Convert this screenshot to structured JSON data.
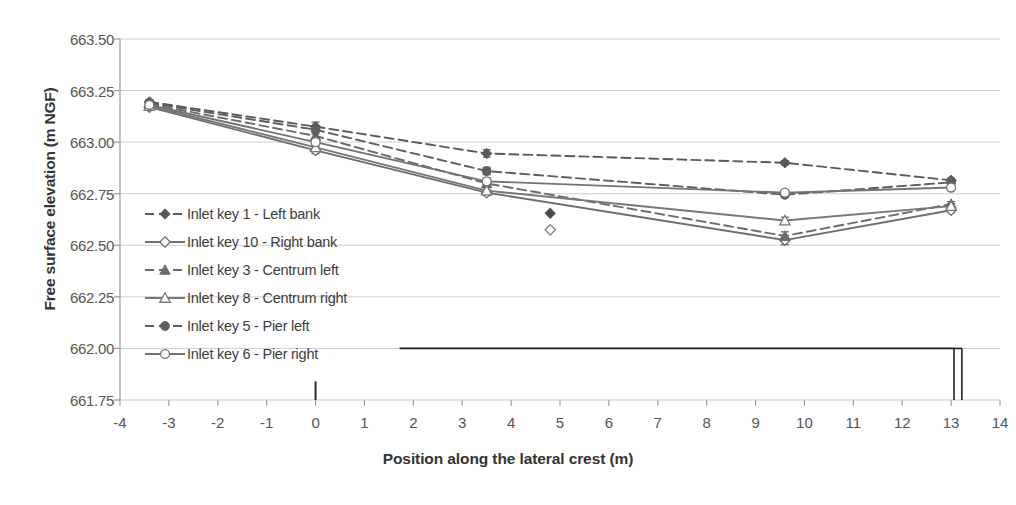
{
  "chart_data": {
    "type": "line",
    "title": "",
    "xlabel": "Position along the lateral crest (m)",
    "ylabel": "Free surface elevation (m NGF)",
    "xlim": [
      -4,
      14
    ],
    "ylim": [
      661.75,
      663.5
    ],
    "ytick_step": 0.25,
    "xtick_step": 1,
    "grid": "horizontal",
    "legend_position": "inside-left",
    "xticks": [
      "-4",
      "-3",
      "-2",
      "-1",
      "0",
      "1",
      "2",
      "3",
      "4",
      "5",
      "6",
      "7",
      "8",
      "9",
      "10",
      "11",
      "12",
      "13",
      "14"
    ],
    "yticks": [
      "661.75",
      "662.00",
      "662.25",
      "662.50",
      "662.75",
      "663.00",
      "663.25",
      "663.50"
    ],
    "x": [
      -3.4,
      0,
      3.5,
      9.6,
      13.0
    ],
    "series": [
      {
        "name": "Inlet key 1 - Left bank",
        "style": "dashed",
        "marker": "diamond-filled",
        "color": "#595959",
        "values": [
          663.195,
          663.075,
          662.945,
          662.9,
          662.815
        ],
        "errors": [
          0.012,
          0.022,
          0.018,
          0.01,
          0.01
        ]
      },
      {
        "name": "Inlet key 10 - Right bank",
        "style": "solid",
        "marker": "diamond-open",
        "color": "#6e6e6e",
        "values": [
          663.17,
          662.96,
          662.755,
          662.525,
          662.67
        ],
        "errors": [
          0.012,
          0.016,
          0.014,
          0.022,
          0.012
        ]
      },
      {
        "name": "Inlet key 3 - Centrum left",
        "style": "dashed",
        "marker": "triangle-filled",
        "color": "#6b6b6b",
        "values": [
          663.185,
          663.03,
          662.8,
          662.545,
          662.7
        ],
        "errors": [
          0.012,
          0.018,
          0.016,
          0.02,
          0.012
        ]
      },
      {
        "name": "Inlet key 8 - Centrum right",
        "style": "solid",
        "marker": "triangle-open",
        "color": "#787878",
        "values": [
          663.175,
          662.975,
          662.765,
          662.62,
          662.69
        ],
        "errors": [
          0.012,
          0.016,
          0.014,
          0.016,
          0.012
        ]
      },
      {
        "name": "Inlet key 5 - Pier left",
        "style": "dashed",
        "marker": "circle-filled",
        "color": "#5f5f5f",
        "values": [
          663.19,
          663.06,
          662.86,
          662.745,
          662.805
        ],
        "errors": [
          0.012,
          0.02,
          0.018,
          0.012,
          0.01
        ]
      },
      {
        "name": "Inlet key 6 - Pier right",
        "style": "solid",
        "marker": "circle-open",
        "color": "#737373",
        "values": [
          663.18,
          663.0,
          662.81,
          662.755,
          662.78
        ],
        "errors": [
          0.012,
          0.018,
          0.016,
          0.012,
          0.01
        ]
      }
    ],
    "isolated_points": [
      {
        "x": 4.8,
        "y": 662.655,
        "marker": "diamond-filled",
        "color": "#4a4a4a"
      },
      {
        "x": 4.8,
        "y": 662.575,
        "marker": "diamond-open",
        "color": "#808080"
      }
    ],
    "crest_profile": {
      "label": "crest-profile",
      "color": "#1f1f1f",
      "y": 662.0,
      "x_start": 1.72,
      "x_end": 13.06,
      "drop_lines_x": [
        13.06,
        13.22
      ],
      "drop_bottom_y": 661.75
    },
    "pier_tick": {
      "x": 0.0,
      "y_bottom": 661.75,
      "y_top": 661.84,
      "color": "#2a2a2a"
    }
  }
}
